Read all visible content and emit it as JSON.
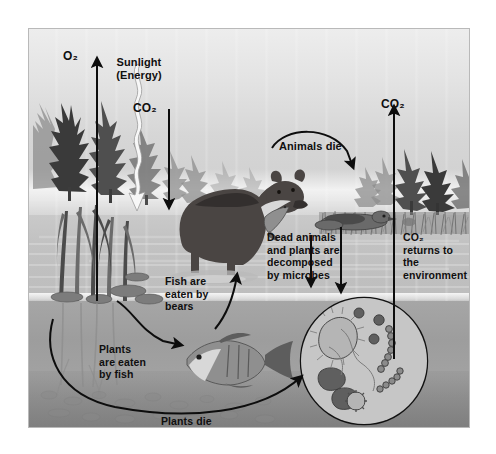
{
  "diagram": {
    "style": "grayscale illustration",
    "frame": {
      "border_color": "#b9b9b9",
      "background": "#c9c9c9"
    }
  },
  "labels": {
    "oxygen": "O₂",
    "sunlight": "Sunlight\n(Energy)",
    "co2_in": "CO₂",
    "co2_out": "CO₂",
    "animals_die": "Animals die",
    "dead_decomposed": "Dead animals\nand plants are\ndecomposed\nby microbes",
    "co2_returns": "CO₂\nreturns to\nthe\nenvironment",
    "fish_eaten": "Fish are\neaten by\nbears",
    "plants_eaten": "Plants\nare eaten\nby fish",
    "plants_die": "Plants die"
  },
  "arrows": [
    {
      "name": "oxygen-release-arrow",
      "label": "O₂",
      "direction": "up",
      "from": "aquatic plants",
      "to": "atmosphere"
    },
    {
      "name": "sunlight-arrow",
      "label": "Sunlight (Energy)",
      "direction": "down",
      "from": "sun",
      "to": "aquatic plants",
      "style": "wavy white"
    },
    {
      "name": "co2-uptake-arrow",
      "label": "CO₂",
      "direction": "down",
      "from": "atmosphere",
      "to": "aquatic plants"
    },
    {
      "name": "co2-return-arrow",
      "label": "CO₂",
      "direction": "up",
      "from": "microbes",
      "to": "atmosphere"
    },
    {
      "name": "animals-die-arrow",
      "label": "Animals die",
      "direction": "curved",
      "from": "bear",
      "to": "dead animal"
    },
    {
      "name": "dead-animal-decompose-arrow",
      "direction": "down",
      "from": "dead animal",
      "to": "microbes"
    },
    {
      "name": "fish-eaten-arrow",
      "label": "Fish are eaten by bears",
      "direction": "curved up",
      "from": "fish",
      "to": "bear"
    },
    {
      "name": "plants-eaten-arrow",
      "label": "Plants are eaten by fish",
      "direction": "curved",
      "from": "plants",
      "to": "fish"
    },
    {
      "name": "plants-die-arrow",
      "label": "Plants die",
      "direction": "curved",
      "from": "plants",
      "to": "microbes"
    }
  ],
  "organisms": [
    {
      "name": "conifer-trees-left",
      "kind": "evergreen forest",
      "location": "left shore"
    },
    {
      "name": "conifer-trees-right",
      "kind": "evergreen forest",
      "location": "right shore"
    },
    {
      "name": "aquatic-plants",
      "kind": "reeds and lily pads",
      "location": "left shallow water"
    },
    {
      "name": "bear",
      "kind": "brown bear holding a fish",
      "location": "center, standing in water"
    },
    {
      "name": "fish",
      "kind": "bass",
      "location": "underwater center"
    },
    {
      "name": "dead-animal",
      "kind": "dead waterfowl",
      "location": "right shore grass"
    },
    {
      "name": "microbes",
      "kind": "bacteria magnification",
      "location": "lower right, inside circle"
    }
  ],
  "microbe_circle": {
    "name": "microbe-magnifier",
    "contents": [
      "ciliated rod bacterium",
      "cocci",
      "bean-shaped bacilli",
      "chain bacteria",
      "spirillum",
      "radial microbe"
    ]
  }
}
